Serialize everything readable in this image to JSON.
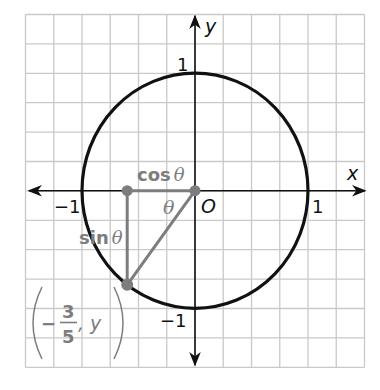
{
  "diagram": {
    "type": "unit-circle",
    "grid": {
      "left": 25.5,
      "top": 14.5,
      "cols": 12,
      "rows": 12,
      "col_step": 28.25,
      "row_step": 29.4
    },
    "origin": {
      "x": 195,
      "y": 190.7
    },
    "point": {
      "x_value": "-3/5",
      "y_value": "y"
    },
    "colors": {
      "grid": "#c9c9c9",
      "axis": "#111111",
      "circle": "#111111",
      "gray": "#7d7d7d"
    }
  },
  "labels": {
    "x_axis": "x",
    "y_axis": "y",
    "origin": "O",
    "x_pos1": "1",
    "x_neg1": "−1",
    "y_pos1": "1",
    "y_neg1": "−1",
    "cos": "cos",
    "sin": "sin",
    "theta": "θ",
    "theta_angle": "θ",
    "point_minus": "−",
    "point_num": "3",
    "point_den": "5",
    "point_comma_y": ", y"
  }
}
